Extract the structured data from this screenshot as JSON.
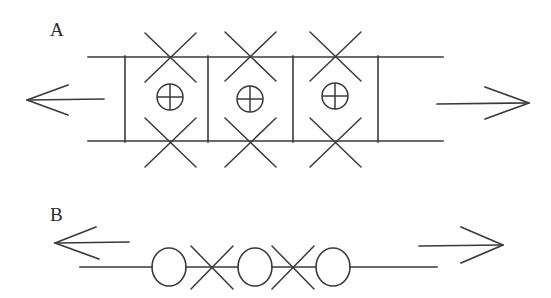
{
  "figure": {
    "width": 551,
    "height": 298,
    "background_color": "#ffffff",
    "stroke_color": "#3a3a3a",
    "panels": [
      {
        "id": "A",
        "label": "A",
        "label_x": 50,
        "label_y": 20,
        "description": "Double horizontal rail with three boxed compartments; each compartment contains a circled-plus symbol, with an X mark on the top rail and an X mark on the bottom rail above and below each compartment. A leftward arrow on the left and a rightward arrow on the right.",
        "rails": {
          "x_start": 88,
          "x_end": 443,
          "y_top": 57,
          "y_bottom": 141
        },
        "verticals_x": [
          125,
          208,
          293,
          378
        ],
        "cell_centers_x": [
          170,
          250,
          335
        ],
        "circle_plus": {
          "cy": 97,
          "r": 13,
          "centers_x": [
            170,
            250,
            335
          ]
        },
        "x_marks_top": {
          "cy": 57,
          "arm": 28,
          "centers_x": [
            170,
            250,
            335
          ]
        },
        "x_marks_bottom": {
          "cy": 142,
          "arm": 28,
          "centers_x": [
            170,
            250,
            335
          ]
        },
        "arrow_left": {
          "tip_x": 27,
          "tail_x": 104,
          "y": 100,
          "head_len": 26,
          "head_spread": 14
        },
        "arrow_right": {
          "tip_x": 529,
          "tail_x": 437,
          "y": 103,
          "head_len": 28,
          "head_spread": 15
        }
      },
      {
        "id": "B",
        "label": "B",
        "label_x": 50,
        "label_y": 205,
        "description": "Single horizontal line bearing three open circles separated by two X marks. A leftward arrow above-left and a rightward arrow above-right.",
        "axis": {
          "x_start": 80,
          "x_end": 437,
          "y": 267
        },
        "circles": {
          "cy": 267,
          "rx": 17,
          "ry": 19,
          "centers_x": [
            169,
            255,
            333
          ]
        },
        "x_marks": {
          "cy": 267,
          "arm": 24,
          "centers_x": [
            212,
            293
          ]
        },
        "arrow_left": {
          "tip_x": 55,
          "tail_x": 129,
          "y": 243,
          "head_len": 26,
          "head_spread": 14
        },
        "arrow_right": {
          "tip_x": 503,
          "tail_x": 419,
          "y": 245,
          "head_len": 28,
          "head_spread": 16
        }
      }
    ]
  }
}
